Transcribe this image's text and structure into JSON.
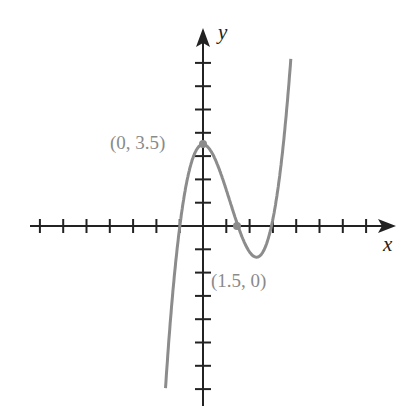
{
  "axes": {
    "x_label": "x",
    "y_label": "y"
  },
  "points": [
    {
      "label": "(0, 3.5)",
      "x": 0,
      "y": 3.5
    },
    {
      "label": "(1.5, 0)",
      "x": 1.5,
      "y": 0
    }
  ],
  "curve": {
    "type": "cubic",
    "description": "graph of a cubic polynomial with local max at (0, 3.5) and root at (1.5, 0)",
    "color": "#8c8c8c"
  },
  "ticks": {
    "x_min": -7,
    "x_max": 7,
    "y_min": -7,
    "y_max": 7,
    "unit": 1
  }
}
